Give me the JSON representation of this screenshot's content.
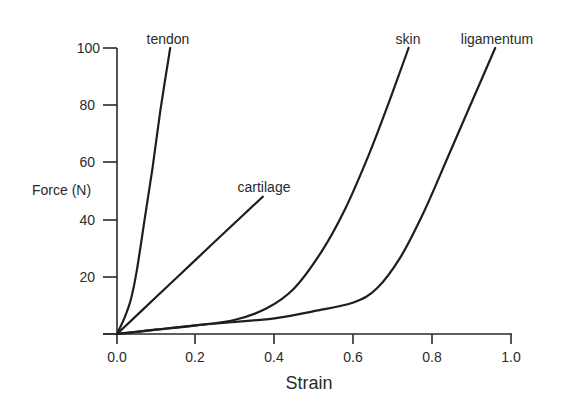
{
  "chart_data": {
    "type": "line",
    "title": "",
    "xlabel": "Strain",
    "ylabel": "Force (N)",
    "xlim": [
      0.0,
      1.0
    ],
    "ylim": [
      0,
      100
    ],
    "grid": false,
    "legend": "inline labels at curve ends",
    "x_ticks": [
      "0.0",
      "0.2",
      "0.4",
      "0.6",
      "0.8",
      "1.0"
    ],
    "y_ticks": [
      "20",
      "40",
      "60",
      "80",
      "100"
    ],
    "series": [
      {
        "name": "tendon",
        "points": [
          [
            0.0,
            0
          ],
          [
            0.02,
            6
          ],
          [
            0.035,
            12
          ],
          [
            0.05,
            22
          ],
          [
            0.07,
            40
          ],
          [
            0.09,
            58
          ],
          [
            0.11,
            78
          ],
          [
            0.135,
            100
          ]
        ]
      },
      {
        "name": "cartilage",
        "points": [
          [
            0.0,
            0
          ],
          [
            0.1,
            13
          ],
          [
            0.2,
            26
          ],
          [
            0.3,
            39
          ],
          [
            0.37,
            48
          ]
        ]
      },
      {
        "name": "skin",
        "points": [
          [
            0.0,
            0
          ],
          [
            0.1,
            1.5
          ],
          [
            0.2,
            3
          ],
          [
            0.3,
            5
          ],
          [
            0.38,
            9
          ],
          [
            0.45,
            16
          ],
          [
            0.52,
            29
          ],
          [
            0.58,
            44
          ],
          [
            0.64,
            63
          ],
          [
            0.69,
            81
          ],
          [
            0.74,
            100
          ]
        ]
      },
      {
        "name": "ligamentum",
        "points": [
          [
            0.0,
            0
          ],
          [
            0.2,
            3
          ],
          [
            0.4,
            5.5
          ],
          [
            0.5,
            8
          ],
          [
            0.6,
            11
          ],
          [
            0.66,
            16
          ],
          [
            0.72,
            27
          ],
          [
            0.78,
            43
          ],
          [
            0.84,
            62
          ],
          [
            0.9,
            81
          ],
          [
            0.96,
            100
          ]
        ]
      }
    ]
  },
  "labels": {
    "xlabel": "Strain",
    "ylabel": "Force (N)",
    "x0": "0.0",
    "x1": "0.2",
    "x2": "0.4",
    "x3": "0.6",
    "x4": "0.8",
    "x5": "1.0",
    "y1": "20",
    "y2": "40",
    "y3": "60",
    "y4": "80",
    "y5": "100",
    "tendon": "tendon",
    "cartilage": "cartilage",
    "skin": "skin",
    "ligamentum": "ligamentum"
  }
}
